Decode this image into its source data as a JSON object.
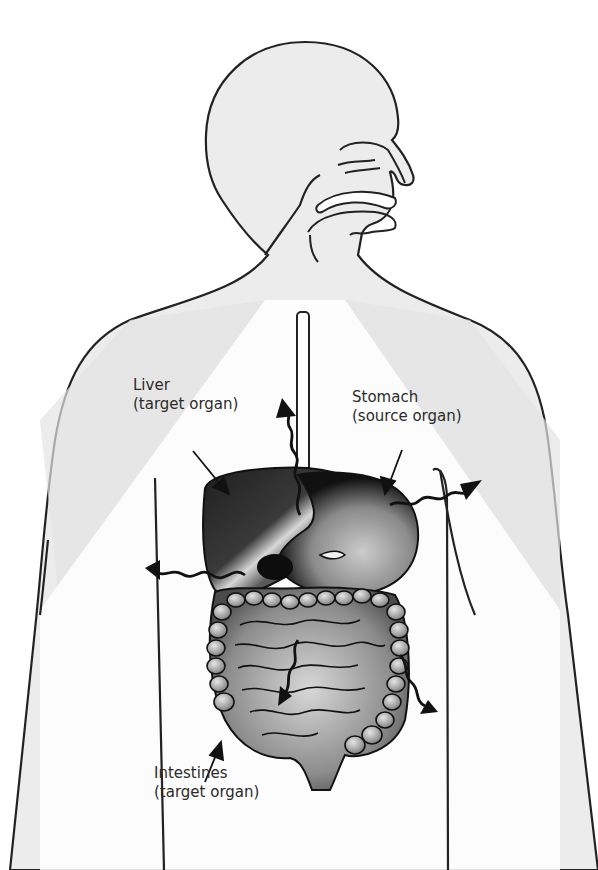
{
  "diagram": {
    "type": "anatomical-diagram",
    "colors": {
      "background": "#ffffff",
      "body_fill": "#ececec",
      "outline": "#222222",
      "shadow_triangles": "#e9e9e9",
      "organ_dark": "#2a2a2a",
      "organ_mid": "#6e6e6e",
      "organ_light": "#cfcfcf",
      "label_text": "#2b2b2b"
    },
    "labels": [
      {
        "id": "liver",
        "line1": "Liver",
        "line2": "(target organ)"
      },
      {
        "id": "stomach",
        "line1": "Stomach",
        "line2": "(source organ)"
      },
      {
        "id": "intestines",
        "line1": "Intestines",
        "line2": "(target organ)"
      }
    ],
    "radiation_arrows": [
      {
        "direction": "up-left",
        "origin": "stomach"
      },
      {
        "direction": "right-up",
        "origin": "stomach"
      },
      {
        "direction": "left",
        "origin": "stomach"
      },
      {
        "direction": "down-right",
        "origin": "intestines"
      },
      {
        "direction": "down-left",
        "origin": "intestines"
      }
    ]
  }
}
